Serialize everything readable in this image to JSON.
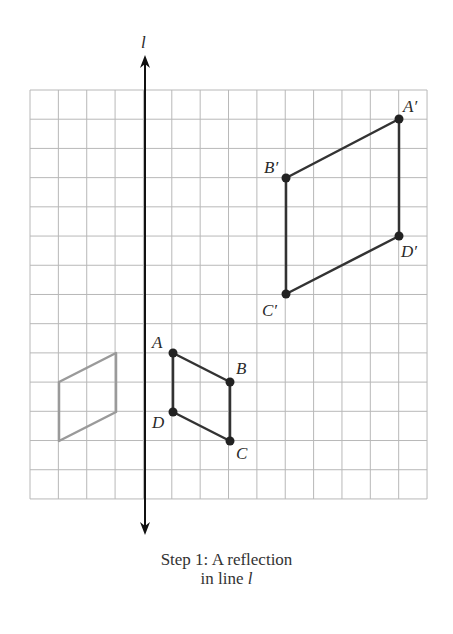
{
  "diagram": {
    "line_label": "l",
    "grid": {
      "x0": 30,
      "y0": 90,
      "cols": 14,
      "rows": 14,
      "cell_w": 28.36,
      "cell_h": 29.21,
      "color": "#b8b8b8"
    },
    "axis": {
      "x": 145,
      "y_top": 55,
      "y_bottom": 535,
      "color": "#111111"
    },
    "original": {
      "color": "#333333",
      "points": [
        {
          "name": "A",
          "x": 173,
          "y": 353,
          "lx": 152,
          "ly": 348
        },
        {
          "name": "B",
          "x": 230,
          "y": 382,
          "lx": 236,
          "ly": 374
        },
        {
          "name": "C",
          "x": 230,
          "y": 441,
          "lx": 236,
          "ly": 459
        },
        {
          "name": "D",
          "x": 173,
          "y": 412,
          "lx": 152,
          "ly": 428
        }
      ]
    },
    "image": {
      "color": "#333333",
      "points": [
        {
          "name": "A′",
          "x": 399,
          "y": 119,
          "lx": 403,
          "ly": 112
        },
        {
          "name": "B′",
          "x": 286,
          "y": 178,
          "lx": 264,
          "ly": 173
        },
        {
          "name": "C′",
          "x": 286,
          "y": 294,
          "lx": 262,
          "ly": 316
        },
        {
          "name": "D′",
          "x": 399,
          "y": 236,
          "lx": 401,
          "ly": 257
        }
      ]
    },
    "reflected": {
      "color": "#9a9a9a",
      "points": [
        {
          "x": 116,
          "y": 353
        },
        {
          "x": 116,
          "y": 412
        },
        {
          "x": 59,
          "y": 441
        },
        {
          "x": 59,
          "y": 382
        }
      ]
    }
  },
  "caption": {
    "line1": "Step 1: A reflection",
    "line2_prefix": "in line ",
    "line2_var": "l"
  }
}
